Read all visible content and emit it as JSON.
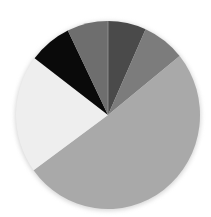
{
  "chart_data": {
    "type": "pie",
    "title": "",
    "legend": [],
    "start_angle_deg": 0,
    "direction": "clockwise",
    "center": [
      108,
      115
    ],
    "radius": [
      92,
      94
    ],
    "slices": [
      {
        "label": "",
        "value": 6.7,
        "color": "#4a4a4a"
      },
      {
        "label": "",
        "value": 7.5,
        "color": "#7c7c7c"
      },
      {
        "label": "",
        "value": 50.8,
        "color": "#a9a9a9"
      },
      {
        "label": "",
        "value": 20.3,
        "color": "#eeeeee"
      },
      {
        "label": "",
        "value": 7.5,
        "color": "#0a0a0a"
      },
      {
        "label": "",
        "value": 7.2,
        "color": "#6e6e6e"
      }
    ]
  }
}
